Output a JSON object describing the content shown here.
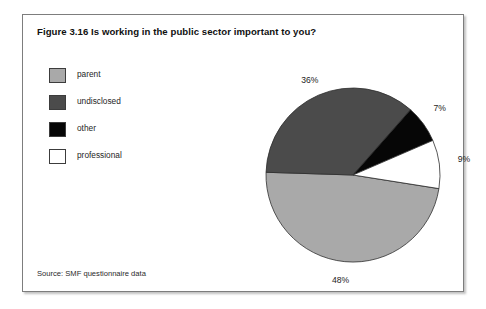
{
  "figure": {
    "title": "Figure 3.16 Is working in the public sector important to you?",
    "source": "Source: SMF questionnaire data"
  },
  "legend": {
    "items": [
      {
        "label": "parent",
        "color": "#a9a9a9"
      },
      {
        "label": "undisclosed",
        "color": "#4b4b4b"
      },
      {
        "label": "other",
        "color": "#060606"
      },
      {
        "label": "professional",
        "color": "#ffffff"
      }
    ]
  },
  "chart_data": {
    "type": "pie",
    "title": "Figure 3.16 Is working in the public sector important to you?",
    "xlabel": "",
    "ylabel": "",
    "legend_position": "left",
    "grid": false,
    "categories": [
      "parent",
      "undisclosed",
      "other",
      "professional"
    ],
    "values": [
      48,
      36,
      7,
      9
    ],
    "value_labels": [
      "48%",
      "36%",
      "7%",
      "9%"
    ],
    "colors": [
      "#a9a9a9",
      "#4b4b4b",
      "#060606",
      "#ffffff"
    ],
    "units": "percent",
    "total": 100,
    "start_angle_deg": 9,
    "direction": "clockwise",
    "annotations": {
      "parent": "48%",
      "undisclosed": "36%",
      "other": "7%",
      "professional": "9%"
    },
    "source": "Source: SMF questionnaire data"
  }
}
